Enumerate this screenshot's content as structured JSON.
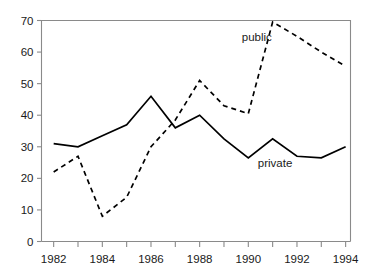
{
  "figure": {
    "top_partial_text": "",
    "background_color": "#ffffff",
    "axis_color": "#8a8a8a",
    "line_color": "#000000"
  },
  "chart_data": {
    "type": "line",
    "title": "",
    "subtitle": "",
    "xlabel": "",
    "ylabel": "",
    "xlim": [
      1981.5,
      1994.2
    ],
    "ylim": [
      0,
      70
    ],
    "grid": false,
    "legend": "inline-annotations",
    "x": [
      1982,
      1983,
      1984,
      1985,
      1986,
      1987,
      1988,
      1989,
      1990,
      1991,
      1992,
      1993,
      1994
    ],
    "xticks": [
      1982,
      1983,
      1984,
      1985,
      1986,
      1987,
      1988,
      1989,
      1990,
      1991,
      1992,
      1993,
      1994
    ],
    "xtick_labels": [
      "1982",
      "",
      "1984",
      "",
      "1986",
      "",
      "1988",
      "",
      "1990",
      "",
      "1992",
      "",
      "1994"
    ],
    "xtick_labels_shown": [
      "1982",
      "1984",
      "1986",
      "1988",
      "1990",
      "1992",
      "1994"
    ],
    "yticks": [
      0,
      10,
      20,
      30,
      40,
      50,
      60,
      70
    ],
    "ytick_labels": [
      "0",
      "10",
      "20",
      "30",
      "40",
      "50",
      "60",
      "70"
    ],
    "series": [
      {
        "name": "public",
        "style": "dashed",
        "label_text": "public",
        "values": [
          22,
          27,
          8,
          14,
          30,
          38.5,
          51,
          43,
          40.5,
          69.5,
          65,
          60,
          55.5
        ]
      },
      {
        "name": "private",
        "style": "solid",
        "label_text": "private",
        "values": [
          31,
          30,
          33.5,
          37,
          46,
          36,
          40,
          32.5,
          26.5,
          32.5,
          27,
          26.5,
          30
        ]
      }
    ],
    "annotations": [
      {
        "text": "public",
        "x": 1990.35,
        "y": 63.5
      },
      {
        "text": "private",
        "x": 1991.1,
        "y": 23.5
      }
    ]
  }
}
